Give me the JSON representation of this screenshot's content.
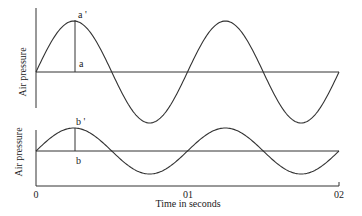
{
  "chart_data": {
    "type": "line",
    "title": "",
    "xlabel": "Time in seconds",
    "x_ticks": [
      "0",
      "01",
      "02"
    ],
    "panels": [
      {
        "name": "upper",
        "ylabel": "Air pressure",
        "series": [
          {
            "name": "wave a",
            "shape": "sine",
            "cycles": 2,
            "relative_amplitude": 1.0
          }
        ],
        "annotations": [
          {
            "label_top": "a'",
            "label_bottom": "a",
            "position": "first peak"
          }
        ]
      },
      {
        "name": "lower",
        "ylabel": "Air pressure",
        "series": [
          {
            "name": "wave b",
            "shape": "sine",
            "cycles": 2,
            "relative_amplitude": 0.45
          }
        ],
        "annotations": [
          {
            "label_top": "b'",
            "label_bottom": "b",
            "position": "first peak"
          }
        ]
      }
    ]
  },
  "upper": {
    "ylabel": "Air pressure",
    "peak_label": "a '",
    "base_label": "a"
  },
  "lower": {
    "ylabel": "Air pressure",
    "peak_label": "b '",
    "base_label": "b"
  },
  "xaxis": {
    "label": "Time in seconds",
    "tick_0": "0",
    "tick_1": "01",
    "tick_2": "02"
  },
  "colors": {
    "line": "#333333",
    "text": "#222222"
  }
}
